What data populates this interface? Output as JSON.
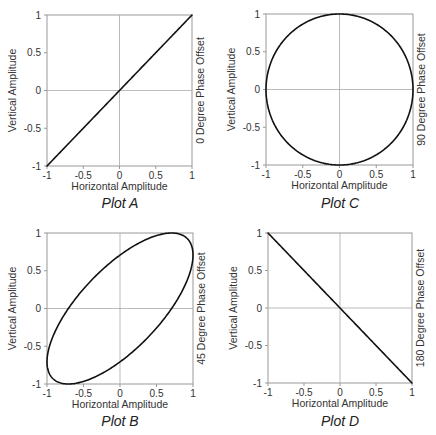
{
  "chart_data": [
    {
      "id": "A",
      "type": "line",
      "title": "Plot A",
      "xlabel": "Horizontal Amplitude",
      "ylabel": "Vertical Amplitude",
      "right_label": "0 Degree Phase Offset",
      "phase_offset_deg": 0,
      "xlim": [
        -1,
        1
      ],
      "ylim": [
        -1,
        1
      ],
      "xticks": [
        -1,
        -0.5,
        0,
        0.5,
        1
      ],
      "yticks": [
        -1,
        -0.5,
        0,
        0.5,
        1
      ],
      "xtick_labels": [
        "-1",
        "-0.5",
        "0",
        "0.5",
        "1"
      ],
      "ytick_labels": [
        "-1",
        "-0.5",
        "0",
        "0.5",
        "1"
      ],
      "grid": "zero-lines",
      "curve": "x = sin(t), y = sin(t + 0°)",
      "points": [
        [
          -1,
          -1
        ],
        [
          -0.5,
          -0.5
        ],
        [
          0,
          0
        ],
        [
          0.5,
          0.5
        ],
        [
          1,
          1
        ]
      ]
    },
    {
      "id": "C",
      "type": "line",
      "title": "Plot C",
      "xlabel": "Horizontal Amplitude",
      "ylabel": "Vertical Amplitude",
      "right_label": "90 Degree Phase Offset",
      "phase_offset_deg": 90,
      "xlim": [
        -1,
        1
      ],
      "ylim": [
        -1,
        1
      ],
      "xticks": [
        -1,
        -0.5,
        0,
        0.5,
        1
      ],
      "yticks": [
        -1,
        -0.5,
        0,
        0.5,
        1
      ],
      "xtick_labels": [
        "-1",
        "-0.5",
        "0",
        "0.5",
        "1"
      ],
      "ytick_labels": [
        "-1",
        "-0.5",
        "0",
        "0.5",
        "1"
      ],
      "grid": "zero-lines",
      "curve": "x = sin(t), y = sin(t + 90°) (circle)",
      "points": [
        [
          0,
          1
        ],
        [
          0.707,
          0.707
        ],
        [
          1,
          0
        ],
        [
          0.707,
          -0.707
        ],
        [
          0,
          -1
        ],
        [
          -0.707,
          -0.707
        ],
        [
          -1,
          0
        ],
        [
          -0.707,
          0.707
        ],
        [
          0,
          1
        ]
      ]
    },
    {
      "id": "B",
      "type": "line",
      "title": "Plot B",
      "xlabel": "Horizontal Amplitude",
      "ylabel": "Vertical Amplitude",
      "right_label": "45 Degree Phase Offset",
      "phase_offset_deg": 45,
      "xlim": [
        -1,
        1
      ],
      "ylim": [
        -1,
        1
      ],
      "xticks": [
        -1,
        -0.5,
        0,
        0.5,
        1
      ],
      "yticks": [
        -1,
        -0.5,
        0,
        0.5,
        1
      ],
      "xtick_labels": [
        "-1",
        "-0.5",
        "0",
        "0.5",
        "1"
      ],
      "ytick_labels": [
        "-1",
        "-0.5",
        "0",
        "0.5",
        "1"
      ],
      "grid": "zero-lines",
      "curve": "x = sin(t), y = sin(t + 45°) (tilted ellipse)",
      "points": [
        [
          0,
          0.707
        ],
        [
          0.707,
          1
        ],
        [
          1,
          0.707
        ],
        [
          0.707,
          0
        ],
        [
          0,
          -0.707
        ],
        [
          -0.707,
          -1
        ],
        [
          -1,
          -0.707
        ],
        [
          -0.707,
          0
        ],
        [
          0,
          0.707
        ]
      ]
    },
    {
      "id": "D",
      "type": "line",
      "title": "Plot D",
      "xlabel": "Horizontal Amplitude",
      "ylabel": "Vertical Amplitude",
      "right_label": "180 Degree Phase Offset",
      "phase_offset_deg": 180,
      "xlim": [
        -1,
        1
      ],
      "ylim": [
        -1,
        1
      ],
      "xticks": [
        -1,
        -0.5,
        0,
        0.5,
        1
      ],
      "yticks": [
        -1,
        -0.5,
        0,
        0.5,
        1
      ],
      "xtick_labels": [
        "-1",
        "-0.5",
        "0",
        "0.5",
        "1"
      ],
      "ytick_labels": [
        "-1",
        "-0.5",
        "0",
        "0.5",
        "1"
      ],
      "grid": "zero-lines",
      "curve": "x = sin(t), y = sin(t + 180°)",
      "points": [
        [
          -1,
          1
        ],
        [
          -0.5,
          0.5
        ],
        [
          0,
          0
        ],
        [
          0.5,
          -0.5
        ],
        [
          1,
          -1
        ]
      ]
    }
  ],
  "layout": {
    "boxes": {
      "A": {
        "x": 47,
        "y": 15,
        "w": 145,
        "h": 151
      },
      "C": {
        "x": 266,
        "y": 14,
        "w": 147,
        "h": 151
      },
      "B": {
        "x": 47,
        "y": 233,
        "w": 146,
        "h": 151
      },
      "D": {
        "x": 268,
        "y": 233,
        "w": 144,
        "h": 150
      }
    }
  },
  "colors": {
    "curve": "#111111",
    "axes_box": "#999999",
    "zero_lines": "#aaaaaa",
    "text": "#333333"
  }
}
